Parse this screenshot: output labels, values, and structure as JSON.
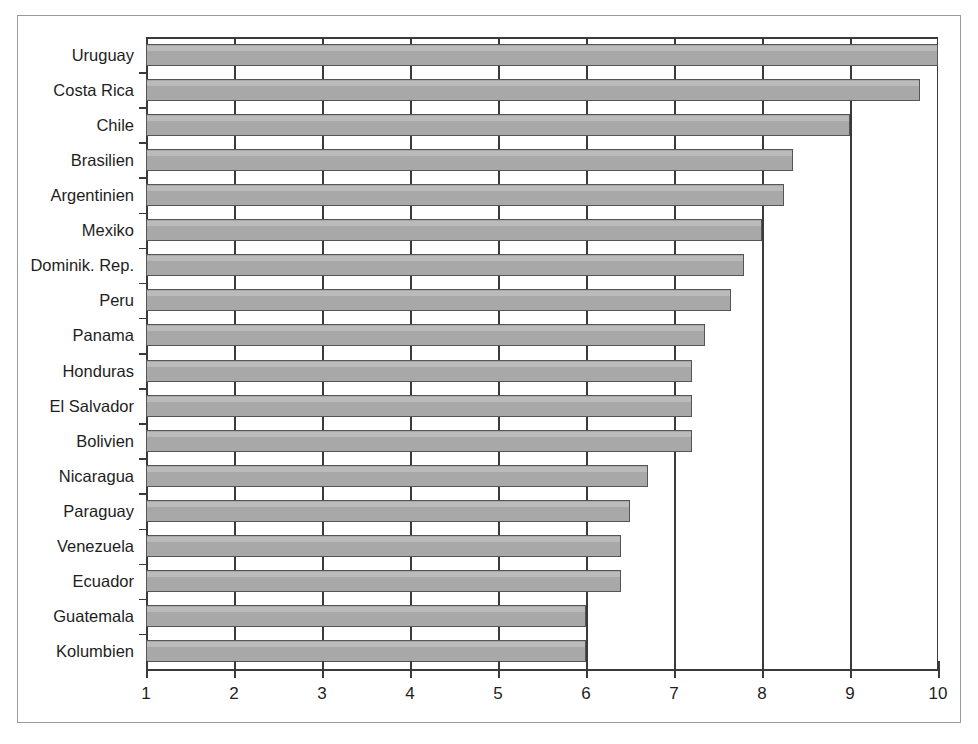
{
  "chart_data": {
    "type": "bar",
    "orientation": "horizontal",
    "title": "",
    "subtitle": "",
    "xlabel": "",
    "ylabel": "",
    "xlim": [
      1,
      10
    ],
    "xticks": [
      "1",
      "2",
      "3",
      "4",
      "5",
      "6",
      "7",
      "8",
      "9",
      "10"
    ],
    "grid": true,
    "grid_axis": "x",
    "legend": false,
    "bar_color": "#a8a8a8",
    "bar_edge_color": "#555555",
    "axis_color": "#3a3a3a",
    "categories": [
      "Uruguay",
      "Costa Rica",
      "Chile",
      "Brasilien",
      "Argentinien",
      "Mexiko",
      "Dominik. Rep.",
      "Peru",
      "Panama",
      "Honduras",
      "El Salvador",
      "Bolivien",
      "Nicaragua",
      "Paraguay",
      "Venezuela",
      "Ecuador",
      "Guatemala",
      "Kolumbien"
    ],
    "values": [
      10.0,
      9.8,
      9.0,
      8.35,
      8.25,
      8.0,
      7.8,
      7.65,
      7.35,
      7.2,
      7.2,
      7.2,
      6.7,
      6.5,
      6.4,
      6.4,
      6.0,
      6.0
    ]
  }
}
